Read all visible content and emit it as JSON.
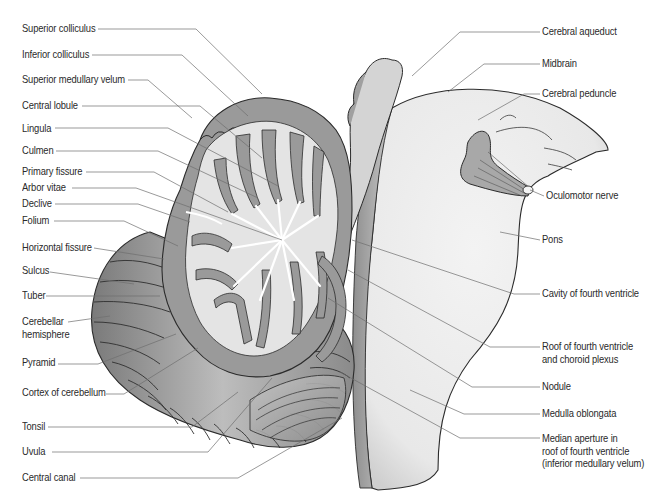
{
  "diagram": {
    "colors": {
      "background": "#ffffff",
      "cortex_grey": "#9a9a9a",
      "white_matter": "#e6e6e6",
      "brainstem": "#ececec",
      "outline": "#2b2b2b",
      "leader_line": "#6e6e6e",
      "label_text": "#2a2a2a"
    },
    "left_labels": [
      {
        "id": "superior-colliculus",
        "text": "Superior colliculus",
        "x": 22,
        "y": 23,
        "line": [
          [
            98,
            29
          ],
          [
            196,
            29
          ],
          [
            262,
            94
          ]
        ]
      },
      {
        "id": "inferior-colliculus",
        "text": "Inferior colliculus",
        "x": 22,
        "y": 49,
        "line": [
          [
            92,
            55
          ],
          [
            182,
            55
          ],
          [
            248,
            116
          ]
        ]
      },
      {
        "id": "superior-medullary-velum",
        "text": "Superior medullary velum",
        "x": 22,
        "y": 74,
        "line": [
          [
            128,
            80
          ],
          [
            148,
            80
          ],
          [
            192,
            118
          ]
        ]
      },
      {
        "id": "central-lobule",
        "text": "Central lobule",
        "x": 22,
        "y": 100,
        "line": [
          [
            82,
            106
          ],
          [
            200,
            106
          ],
          [
            262,
            158
          ]
        ]
      },
      {
        "id": "lingula",
        "text": "Lingula",
        "x": 22,
        "y": 123,
        "line": [
          [
            55,
            128
          ],
          [
            168,
            128
          ],
          [
            278,
            186
          ]
        ]
      },
      {
        "id": "culmen",
        "text": "Culmen",
        "x": 22,
        "y": 145,
        "line": [
          [
            56,
            151
          ],
          [
            158,
            151
          ],
          [
            258,
            198
          ]
        ]
      },
      {
        "id": "primary-fissure",
        "text": "Primary fissure",
        "x": 22,
        "y": 166,
        "line": [
          [
            86,
            172
          ],
          [
            154,
            172
          ],
          [
            228,
            212
          ]
        ]
      },
      {
        "id": "arbor-vitae",
        "text": "Arbor vitae",
        "x": 22,
        "y": 183,
        "line": [
          [
            72,
            188
          ],
          [
            136,
            188
          ],
          [
            282,
            240
          ]
        ]
      },
      {
        "id": "declive",
        "text": "Declive",
        "x": 22,
        "y": 199,
        "line": [
          [
            55,
            204
          ],
          [
            138,
            204
          ],
          [
            190,
            222
          ]
        ]
      },
      {
        "id": "folium",
        "text": "Folium",
        "x": 22,
        "y": 216,
        "line": [
          [
            54,
            221
          ],
          [
            124,
            221
          ],
          [
            178,
            246
          ]
        ]
      },
      {
        "id": "horizontal-fissure",
        "text": "Horizontal fissure",
        "x": 22,
        "y": 242,
        "line": [
          [
            94,
            248
          ],
          [
            164,
            259
          ]
        ]
      },
      {
        "id": "sulcus",
        "text": "Sulcus",
        "x": 22,
        "y": 264,
        "line": [
          [
            50,
            272
          ],
          [
            134,
            284
          ]
        ]
      },
      {
        "id": "tuber",
        "text": "Tuber",
        "x": 22,
        "y": 286,
        "line": [
          [
            46,
            296
          ],
          [
            160,
            296
          ]
        ]
      },
      {
        "id": "cerebellar-hemisphere",
        "text": "Cerebellar\nhemisphere",
        "x": 22,
        "y": 317,
        "line": [
          [
            68,
            322
          ],
          [
            110,
            316
          ]
        ]
      },
      {
        "id": "pyramid",
        "text": "Pyramid",
        "x": 22,
        "y": 359,
        "line": [
          [
            58,
            364
          ],
          [
            98,
            364
          ],
          [
            176,
            334
          ]
        ]
      },
      {
        "id": "cortex-of-cerebellum",
        "text": "Cortex of cerebellum",
        "x": 22,
        "y": 389,
        "line": [
          [
            106,
            394
          ],
          [
            124,
            394
          ],
          [
            198,
            348
          ]
        ]
      },
      {
        "id": "tonsil",
        "text": "Tonsil",
        "x": 22,
        "y": 421,
        "line": [
          [
            48,
            427
          ],
          [
            192,
            427
          ],
          [
            238,
            392
          ]
        ]
      },
      {
        "id": "uvula",
        "text": "Uvula",
        "x": 22,
        "y": 447,
        "line": [
          [
            52,
            452
          ],
          [
            208,
            452
          ],
          [
            272,
            378
          ]
        ]
      },
      {
        "id": "central-canal",
        "text": "Central canal",
        "x": 22,
        "y": 472,
        "line": [
          [
            80,
            478
          ],
          [
            238,
            478
          ],
          [
            342,
            418
          ]
        ]
      }
    ],
    "right_labels": [
      {
        "id": "cerebral-aqueduct",
        "text": "Cerebral aqueduct",
        "x": 542,
        "y": 26,
        "line": [
          [
            540,
            32
          ],
          [
            460,
            32
          ],
          [
            412,
            76
          ]
        ]
      },
      {
        "id": "midbrain",
        "text": "Midbrain",
        "x": 542,
        "y": 58,
        "line": [
          [
            540,
            64
          ],
          [
            484,
            64
          ],
          [
            448,
            92
          ]
        ]
      },
      {
        "id": "cerebral-peduncle",
        "text": "Cerebral peduncle",
        "x": 542,
        "y": 88,
        "line": [
          [
            540,
            94
          ],
          [
            524,
            94
          ],
          [
            478,
            120
          ]
        ]
      },
      {
        "id": "oculomotor-nerve",
        "text": "Oculomotor nerve",
        "x": 546,
        "y": 190,
        "line": [
          [
            544,
            196
          ],
          [
            530,
            190
          ]
        ]
      },
      {
        "id": "pons",
        "text": "Pons",
        "x": 542,
        "y": 234,
        "line": [
          [
            540,
            240
          ],
          [
            500,
            232
          ]
        ]
      },
      {
        "id": "cavity-of-fourth-ventricle",
        "text": "Cavity of fourth ventricle",
        "x": 542,
        "y": 286,
        "line": [
          [
            540,
            294
          ],
          [
            514,
            294
          ],
          [
            352,
            240
          ]
        ]
      },
      {
        "id": "roof-of-fourth-ventricle",
        "text": "Roof of fourth ventricle\nand choroid plexus",
        "x": 542,
        "y": 341,
        "line": [
          [
            540,
            347
          ],
          [
            490,
            347
          ],
          [
            348,
            270
          ]
        ]
      },
      {
        "id": "nodule",
        "text": "Nodule",
        "x": 542,
        "y": 381,
        "line": [
          [
            540,
            387
          ],
          [
            472,
            387
          ],
          [
            328,
            298
          ]
        ]
      },
      {
        "id": "medulla-oblongata",
        "text": "Medulla oblongata",
        "x": 542,
        "y": 407,
        "line": [
          [
            540,
            414
          ],
          [
            464,
            414
          ],
          [
            410,
            390
          ]
        ]
      },
      {
        "id": "median-aperture",
        "text": "Median aperture in\nroof of fourth ventricle\n(inferior medullary velum)",
        "x": 542,
        "y": 433,
        "line": [
          [
            540,
            438
          ],
          [
            460,
            438
          ],
          [
            340,
            372
          ]
        ]
      }
    ]
  }
}
